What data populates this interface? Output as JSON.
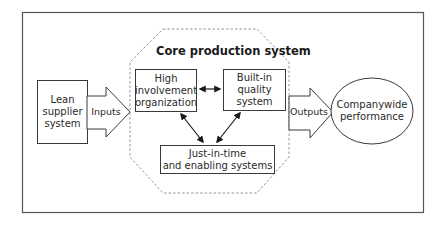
{
  "diagram": {
    "title": "Core production system",
    "nodes": {
      "lean_supplier": {
        "lines": [
          "Lean",
          "supplier",
          "system"
        ]
      },
      "high_involvement": {
        "lines": [
          "High",
          "involvement",
          "organization"
        ]
      },
      "built_in_quality": {
        "lines": [
          "Built-in",
          "quality",
          "system"
        ]
      },
      "jit": {
        "lines": [
          "Just-in-time",
          "and enabling systems"
        ]
      },
      "companywide": {
        "lines": [
          "Companywide",
          "performance"
        ]
      }
    },
    "arrows": {
      "inputs": "Inputs",
      "outputs": "Outputs"
    },
    "edges": [
      {
        "from": "high_involvement",
        "to": "built_in_quality",
        "type": "bidirectional"
      },
      {
        "from": "high_involvement",
        "to": "jit",
        "type": "bidirectional"
      },
      {
        "from": "built_in_quality",
        "to": "jit",
        "type": "bidirectional"
      },
      {
        "from": "lean_supplier",
        "to": "core_production_system",
        "label": "Inputs"
      },
      {
        "from": "core_production_system",
        "to": "companywide",
        "label": "Outputs"
      }
    ],
    "colors": {
      "stroke": "#3a3a3a",
      "dashed": "#8a8a8a",
      "background": "#ffffff"
    }
  }
}
